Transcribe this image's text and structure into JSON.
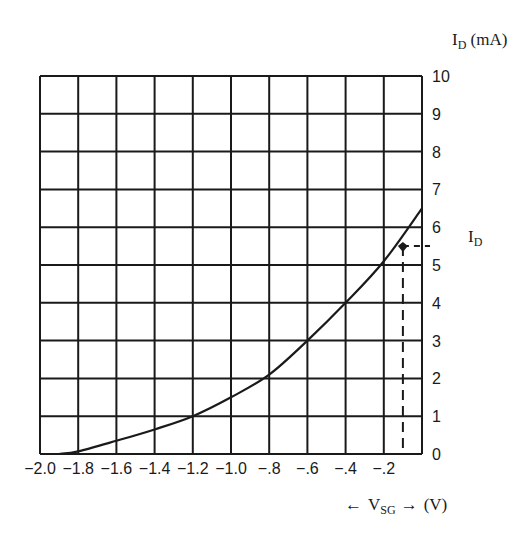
{
  "chart_data": {
    "type": "line",
    "title": "",
    "xlabel": "← V_SG → (V)",
    "ylabel": "I_D (mA)",
    "side_label": "I_D",
    "xlim": [
      -2.0,
      0
    ],
    "ylim": [
      0,
      10
    ],
    "grid": true,
    "x_ticks": [
      "-2.0",
      "-1.8",
      "-1.6",
      "-1.4",
      "-1.2",
      "-1.0",
      "-.8",
      "-.6",
      "-.4",
      "-.2"
    ],
    "y_ticks": [
      "0",
      "1",
      "2",
      "3",
      "4",
      "5",
      "6",
      "7",
      "8",
      "9",
      "10"
    ],
    "series": [
      {
        "name": "I_D vs V_SG",
        "x": [
          -1.9,
          -1.8,
          -1.6,
          -1.4,
          -1.2,
          -1.0,
          -0.8,
          -0.6,
          -0.4,
          -0.2,
          0.0
        ],
        "y": [
          0.0,
          0.07,
          0.35,
          0.65,
          1.0,
          1.5,
          2.1,
          3.0,
          4.0,
          5.1,
          6.5
        ]
      }
    ],
    "annotations": [
      {
        "type": "point",
        "x": -0.1,
        "y": 5.5,
        "note": "operating point with dashed projections to both axes"
      }
    ]
  },
  "labels": {
    "y_axis_main": "I",
    "y_axis_sub": "D",
    "y_axis_unit": " (mA)",
    "side_main": "I",
    "side_sub": "D",
    "x_left_arrow": "←",
    "x_main": "V",
    "x_sub": "SG",
    "x_right_arrow": "→",
    "x_unit": "(V)"
  },
  "colors": {
    "ink": "#1a1a1a",
    "background": "#ffffff"
  }
}
